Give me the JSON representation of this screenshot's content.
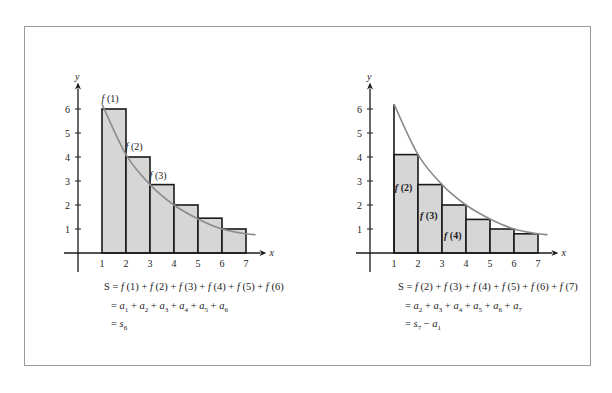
{
  "chart_data": [
    {
      "type": "bar",
      "title": "Left: left-endpoint rectangles (overestimate)",
      "xlabel": "x",
      "ylabel": "y",
      "x_ticks": [
        "1",
        "2",
        "3",
        "4",
        "5",
        "6",
        "7"
      ],
      "y_ticks": [
        "1",
        "2",
        "3",
        "4",
        "5",
        "6"
      ],
      "xlim": [
        0,
        7.5
      ],
      "ylim": [
        0,
        6.5
      ],
      "bars": [
        {
          "x0": 1,
          "x1": 2,
          "height": 6
        },
        {
          "x0": 2,
          "x1": 3,
          "height": 4
        },
        {
          "x0": 3,
          "x1": 4,
          "height": 2.85
        },
        {
          "x0": 4,
          "x1": 5,
          "height": 2
        },
        {
          "x0": 5,
          "x1": 6,
          "height": 1.45
        },
        {
          "x0": 6,
          "x1": 7,
          "height": 1
        }
      ],
      "curve": {
        "name": "f(x)",
        "x": [
          1,
          2,
          3,
          4,
          5,
          6,
          7,
          7.4
        ],
        "y": [
          6.2,
          4.1,
          2.85,
          2,
          1.42,
          1.0,
          0.8,
          0.76
        ]
      },
      "annotations": [
        {
          "text": "f (1)",
          "x": 1.4,
          "y": 6.3
        },
        {
          "text": "f (2)",
          "x": 2.4,
          "y": 4.3
        },
        {
          "text": "f (3)",
          "x": 3.4,
          "y": 3.1
        }
      ]
    },
    {
      "type": "bar",
      "title": "Right: right-endpoint rectangles (underestimate)",
      "xlabel": "x",
      "ylabel": "y",
      "x_ticks": [
        "1",
        "2",
        "3",
        "4",
        "5",
        "6",
        "7"
      ],
      "y_ticks": [
        "1",
        "2",
        "3",
        "4",
        "5",
        "6"
      ],
      "xlim": [
        0,
        7.5
      ],
      "ylim": [
        0,
        6.5
      ],
      "bars": [
        {
          "x0": 1,
          "x1": 2,
          "height": 4.1
        },
        {
          "x0": 2,
          "x1": 3,
          "height": 2.85
        },
        {
          "x0": 3,
          "x1": 4,
          "height": 2
        },
        {
          "x0": 4,
          "x1": 5,
          "height": 1.4
        },
        {
          "x0": 5,
          "x1": 6,
          "height": 1.0
        },
        {
          "x0": 6,
          "x1": 7,
          "height": 0.8
        }
      ],
      "curve": {
        "name": "f(x)",
        "x": [
          1,
          2,
          3,
          4,
          5,
          6,
          7,
          7.4
        ],
        "y": [
          6.2,
          4.1,
          2.85,
          2,
          1.42,
          1.0,
          0.8,
          0.76
        ]
      },
      "annotations": [
        {
          "text": "f (2)",
          "x": 1.45,
          "y": 2.6
        },
        {
          "text": "f (3)",
          "x": 2.5,
          "y": 1.4
        },
        {
          "text": "f (4)",
          "x": 3.5,
          "y": 0.6
        }
      ]
    }
  ],
  "left_equations": {
    "line1_prefix": "S = ",
    "line1": [
      "f (1)",
      "f (2)",
      "f (3)",
      "f (4)",
      "f (5)",
      "f (6)"
    ],
    "line2": [
      "1",
      "2",
      "3",
      "4",
      "5",
      "6"
    ],
    "line3_sub": "6"
  },
  "right_equations": {
    "line1_prefix": "S = ",
    "line1": [
      "f (2)",
      "f (3)",
      "f (4)",
      "f (5)",
      "f (6)",
      "f (7)"
    ],
    "line2": [
      "2",
      "3",
      "4",
      "5",
      "6",
      "7"
    ],
    "line3_s_sub": "7",
    "line3_a_sub": "1"
  },
  "colors": {
    "fill": "#d6d6d6",
    "curve": "#8c8c8c",
    "stroke": "#1a1a1a",
    "frame": "#9a9a9a"
  }
}
